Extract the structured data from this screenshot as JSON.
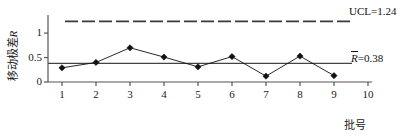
{
  "chart_data": {
    "type": "line",
    "title": "",
    "xlabel": "批号",
    "ylabel_prefix": "移动极差",
    "ylabel_italic": "R",
    "categories": [
      1,
      2,
      3,
      4,
      5,
      6,
      7,
      8,
      9,
      10
    ],
    "x_tick_labels": [
      "1",
      "2",
      "3",
      "4",
      "5",
      "6",
      "7",
      "8",
      "9",
      "10"
    ],
    "y_tick_labels": [
      "0",
      "0.5",
      "1"
    ],
    "y_tick_values": [
      0,
      0.5,
      1
    ],
    "xlim": [
      0.5,
      10.5
    ],
    "ylim": [
      0,
      1.35
    ],
    "grid": false,
    "legend": "none",
    "marker": "diamond",
    "series": [
      {
        "name": "移动极差R",
        "x": [
          1,
          2,
          3,
          4,
          5,
          6,
          7,
          8,
          9
        ],
        "values": [
          0.29,
          0.4,
          0.7,
          0.51,
          0.31,
          0.52,
          0.12,
          0.53,
          0.13
        ],
        "color": "#111111"
      }
    ],
    "control_limits": [
      {
        "id": "ucl",
        "label": "UCL=1.24",
        "label_text_plain": "UCL=1.24",
        "value": 1.24,
        "style": "dashed",
        "color": "#3a3a3a"
      },
      {
        "id": "center-line",
        "label": "R̄=0.38",
        "label_symbol": "R",
        "label_suffix": "=0.38",
        "value": 0.38,
        "style": "solid",
        "color": "#444444"
      }
    ],
    "axis_color": "#555555"
  }
}
